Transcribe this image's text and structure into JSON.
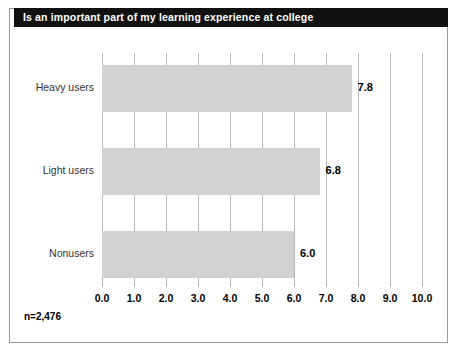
{
  "figure": {
    "title": "Is an important part of my learning experience at college",
    "sample_note": "n=2,476",
    "banner_color": "#111111",
    "bar_color": "#d2d2d2",
    "grid_color": "#b8b8b8"
  },
  "chart_data": {
    "type": "bar",
    "orientation": "horizontal",
    "title": "Is an important part of my learning experience at college",
    "categories": [
      "Heavy users",
      "Light users",
      "Nonusers"
    ],
    "values": [
      7.8,
      6.8,
      6.0
    ],
    "value_labels": [
      "7.8",
      "6.8",
      "6.0"
    ],
    "xlabel": "",
    "ylabel": "",
    "xlim": [
      0.0,
      10.0
    ],
    "xticks": [
      0.0,
      1.0,
      2.0,
      3.0,
      4.0,
      5.0,
      6.0,
      7.0,
      8.0,
      9.0,
      10.0
    ],
    "xtick_labels": [
      "0.0",
      "1.0",
      "2.0",
      "3.0",
      "4.0",
      "5.0",
      "6.0",
      "7.0",
      "8.0",
      "9.0",
      "10.0"
    ],
    "grid": "vertical",
    "legend": "none",
    "annotations": [
      "n=2,476"
    ],
    "sample_size": 2476
  }
}
